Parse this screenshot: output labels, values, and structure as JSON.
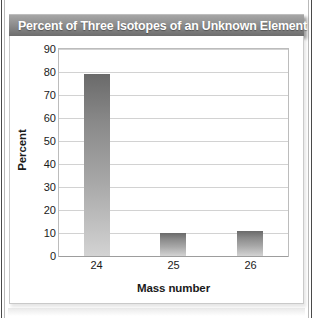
{
  "figure": {
    "title": "Percent of Three Isotopes of an Unknown Element",
    "top_bleed_text": ""
  },
  "chart_data": {
    "type": "bar",
    "title": "Percent of Three Isotopes of an Unknown Element",
    "categories": [
      "24",
      "25",
      "26"
    ],
    "values": [
      79,
      10,
      11
    ],
    "series": [
      {
        "name": "Percent",
        "values": [
          79,
          10,
          11
        ]
      }
    ],
    "xlabel": "Mass number",
    "ylabel": "Percent",
    "ylim": [
      0,
      90
    ],
    "ytick_step": 10,
    "yticks": [
      "90",
      "80",
      "70",
      "60",
      "50",
      "40",
      "30",
      "20",
      "10",
      "0"
    ],
    "grid": "horizontal",
    "legend": "none",
    "bar_color": "#8b8b8b",
    "title_bar_color": "#8e8e8e",
    "gridline_color": "#d2d2d2"
  }
}
